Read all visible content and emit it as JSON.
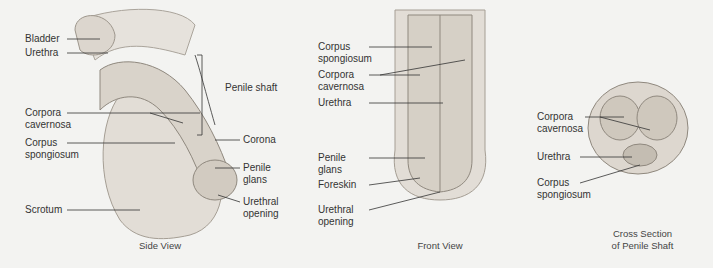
{
  "figure": {
    "panels": [
      {
        "id": "side",
        "caption": "Side View",
        "labels": [
          "Bladder",
          "Urethra",
          "Penile shaft",
          "Corpora\ncavernosa",
          "Corpus\nspongiosum",
          "Corona",
          "Penile\nglans",
          "Urethral\nopening",
          "Scrotum"
        ]
      },
      {
        "id": "front",
        "caption": "Front View",
        "labels": [
          "Corpus\nspongiosum",
          "Corpora\ncavernosa",
          "Urethra",
          "Penile\nglans",
          "Foreskin",
          "Urethral\nopening"
        ]
      },
      {
        "id": "cross",
        "caption": "Cross Section\nof Penile Shaft",
        "labels": [
          "Corpora\ncavernosa",
          "Urethra",
          "Corpus\nspongiosum"
        ]
      }
    ],
    "colors": {
      "background": "#f3f3f1",
      "tissue": "#e2ddd6",
      "tissue_dark": "#b9b2a8",
      "line": "#333333"
    }
  }
}
